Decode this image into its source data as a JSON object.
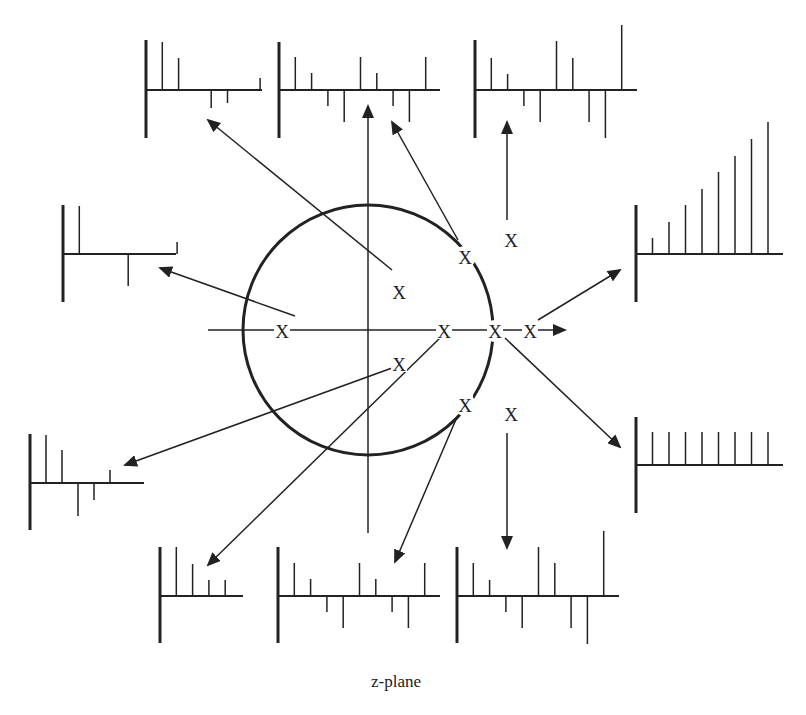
{
  "caption": "z-plane",
  "colors": {
    "ink": "#222222",
    "background": "#ffffff"
  },
  "pole_marker": "X",
  "unit_circle": {
    "cx": 368,
    "cy": 330,
    "r": 125
  },
  "axes": {
    "real": {
      "x1": 208,
      "y1": 330,
      "x2": 565,
      "y2": 330,
      "arrow": true
    },
    "imag": {
      "x1": 368,
      "y1": 533,
      "x2": 368,
      "y2": 106,
      "arrow": true
    }
  },
  "poles": [
    {
      "id": "left-real",
      "x": 282,
      "y": 331,
      "arrow": {
        "x1": 295,
        "y1": 316,
        "x2": 160,
        "y2": 268
      },
      "plot": "left-top"
    },
    {
      "id": "inside-upper",
      "x": 399,
      "y": 292,
      "arrow": {
        "x1": 392,
        "y1": 270,
        "x2": 208,
        "y2": 120
      },
      "plot": "top-1"
    },
    {
      "id": "inside-lower",
      "x": 399,
      "y": 364,
      "arrow": {
        "x1": 392,
        "y1": 368,
        "x2": 125,
        "y2": 465
      },
      "plot": "left-bottom"
    },
    {
      "id": "real-inside",
      "x": 444,
      "y": 331,
      "arrow": {
        "x1": 442,
        "y1": 336,
        "x2": 208,
        "y2": 565
      },
      "plot": "bottom-1"
    },
    {
      "id": "unit-upper",
      "x": 465,
      "y": 257,
      "arrow": {
        "x1": 458,
        "y1": 240,
        "x2": 392,
        "y2": 122
      },
      "plot": "top-2"
    },
    {
      "id": "unit-lower",
      "x": 465,
      "y": 405,
      "arrow": {
        "x1": 457,
        "y1": 417,
        "x2": 395,
        "y2": 562
      },
      "plot": "bottom-2"
    },
    {
      "id": "unit-real",
      "x": 495,
      "y": 331,
      "arrow": {
        "x1": 505,
        "y1": 338,
        "x2": 620,
        "y2": 447
      },
      "plot": "right-bottom"
    },
    {
      "id": "outside-real",
      "x": 530,
      "y": 331,
      "arrow": {
        "x1": 538,
        "y1": 320,
        "x2": 620,
        "y2": 270
      },
      "plot": "right-top"
    },
    {
      "id": "outside-upper",
      "x": 511,
      "y": 240,
      "arrow": {
        "x1": 507,
        "y1": 220,
        "x2": 507,
        "y2": 122
      },
      "plot": "top-3"
    },
    {
      "id": "outside-lower",
      "x": 511,
      "y": 414,
      "arrow": {
        "x1": 507,
        "y1": 433,
        "x2": 507,
        "y2": 548
      },
      "plot": "bottom-3"
    }
  ],
  "stem_plots": [
    {
      "id": "top-1",
      "origin": [
        146,
        90
      ],
      "yTop": 40,
      "yBot": 138,
      "axisEnd": 262,
      "stems": [
        48,
        32,
        0,
        -18,
        -13,
        0,
        12
      ],
      "spacing": 16.3
    },
    {
      "id": "top-2",
      "origin": [
        279,
        90
      ],
      "yTop": 42,
      "yBot": 138,
      "axisEnd": 440,
      "stems": [
        33,
        17,
        -16,
        -32,
        33,
        17,
        -16,
        -32,
        33
      ],
      "spacing": 16.3
    },
    {
      "id": "top-3",
      "origin": [
        475,
        90
      ],
      "yTop": 40,
      "yBot": 138,
      "axisEnd": 637,
      "stems": [
        32,
        16,
        -16,
        -32,
        49,
        32,
        -32,
        -48,
        65
      ],
      "spacing": 16.3
    },
    {
      "id": "left-top",
      "origin": [
        63,
        254
      ],
      "yTop": 205,
      "yBot": 302,
      "axisEnd": 176,
      "stems": [
        48,
        0,
        0,
        -32,
        0,
        0,
        12
      ],
      "spacing": 16.3
    },
    {
      "id": "left-bottom",
      "origin": [
        30,
        483
      ],
      "yTop": 434,
      "yBot": 530,
      "axisEnd": 144,
      "stems": [
        48,
        33,
        -33,
        -17,
        13
      ],
      "spacing": 16
    },
    {
      "id": "right-top",
      "origin": [
        636,
        254
      ],
      "yTop": 205,
      "yBot": 302,
      "axisEnd": 783,
      "stems": [
        16,
        32,
        49,
        65,
        82,
        98,
        115,
        132
      ],
      "spacing": 16.5
    },
    {
      "id": "right-bottom",
      "origin": [
        636,
        465
      ],
      "yTop": 417,
      "yBot": 513,
      "axisEnd": 783,
      "stems": [
        33,
        33,
        33,
        33,
        33,
        33,
        33,
        33
      ],
      "spacing": 16.5
    },
    {
      "id": "bottom-1",
      "origin": [
        160,
        596
      ],
      "yTop": 547,
      "yBot": 643,
      "axisEnd": 243,
      "stems": [
        49,
        32,
        16,
        16
      ],
      "spacing": 16.3
    },
    {
      "id": "bottom-2",
      "origin": [
        278,
        596
      ],
      "yTop": 547,
      "yBot": 643,
      "axisEnd": 440,
      "stems": [
        33,
        17,
        -16,
        -32,
        33,
        17,
        -16,
        -32,
        33
      ],
      "spacing": 16.3
    },
    {
      "id": "bottom-3",
      "origin": [
        457,
        596
      ],
      "yTop": 547,
      "yBot": 643,
      "axisEnd": 619,
      "stems": [
        33,
        16,
        -16,
        -32,
        49,
        33,
        -32,
        -48,
        65
      ],
      "spacing": 16.3
    }
  ]
}
